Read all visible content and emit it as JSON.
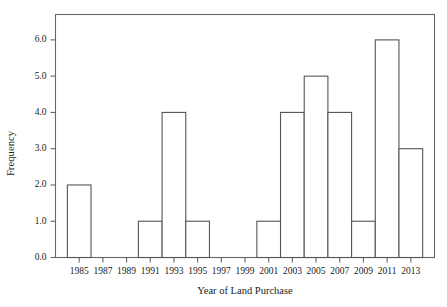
{
  "chart_data": {
    "type": "bar",
    "title": "",
    "subtitle": "",
    "xlabel": "Year of Land Purchase",
    "ylabel": "Frequency",
    "categories": [
      "1985",
      "1987",
      "1989",
      "1991",
      "1993",
      "1995",
      "1997",
      "1999",
      "2001",
      "2003",
      "2005",
      "2007",
      "2009",
      "2011",
      "2013"
    ],
    "values": [
      2,
      0,
      0,
      1,
      4,
      1,
      0,
      0,
      1,
      4,
      5,
      4,
      1,
      6,
      3
    ],
    "xlim": [
      1984,
      2014
    ],
    "ylim": [
      0,
      6.7
    ],
    "ytick_labels": [
      "0.0",
      "1.0",
      "2.0",
      "3.0",
      "4.0",
      "5.0",
      "6.0"
    ],
    "ytick_values": [
      0,
      1,
      2,
      3,
      4,
      5,
      6
    ],
    "xtick_labels": [
      "1985",
      "1987",
      "1989",
      "1991",
      "1993",
      "1995",
      "1997",
      "1999",
      "2001",
      "2003",
      "2005",
      "2007",
      "2009",
      "2011",
      "2013"
    ],
    "grid": false,
    "legend": null,
    "legend_position": "none",
    "bar_fill": "#ffffff",
    "bar_stroke": "#555555",
    "axis_color": "#666666",
    "text_color": "#1a1a1a",
    "frame": "full-box",
    "bin_width_years": 2,
    "annotations": []
  },
  "axes": {
    "y_title": "Frequency",
    "x_title": "Year of Land Purchase"
  }
}
